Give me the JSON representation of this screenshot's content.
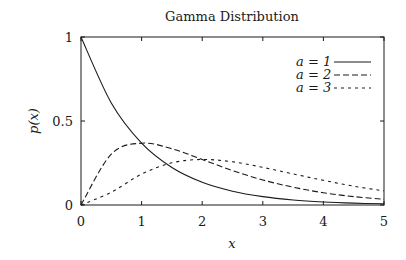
{
  "chart_data": {
    "type": "line",
    "title": "Gamma Distribution",
    "xlabel": "x",
    "ylabel": "p(x)",
    "xlim": [
      0,
      5
    ],
    "ylim": [
      0,
      1
    ],
    "grid": false,
    "legend_position": "upper right",
    "x_ticks": [
      "0",
      "1",
      "2",
      "3",
      "4",
      "5"
    ],
    "y_ticks": [
      "0",
      "0.5",
      "1"
    ],
    "x": [
      0,
      0.5,
      1,
      1.5,
      2,
      2.5,
      3,
      3.5,
      4,
      4.5,
      5
    ],
    "series": [
      {
        "name": "a = 1",
        "style": "solid",
        "values": [
          1.0,
          0.607,
          0.368,
          0.223,
          0.135,
          0.082,
          0.05,
          0.03,
          0.018,
          0.011,
          0.007
        ]
      },
      {
        "name": "a = 2",
        "style": "dashed",
        "values": [
          0.0,
          0.303,
          0.368,
          0.335,
          0.271,
          0.205,
          0.149,
          0.106,
          0.073,
          0.05,
          0.034
        ]
      },
      {
        "name": "a = 3",
        "style": "dotted",
        "values": [
          0.0,
          0.076,
          0.184,
          0.251,
          0.271,
          0.257,
          0.224,
          0.185,
          0.147,
          0.112,
          0.084
        ]
      }
    ]
  },
  "labels": {
    "title": "Gamma Distribution",
    "xlabel": "x",
    "ylabel": "p(x)"
  }
}
